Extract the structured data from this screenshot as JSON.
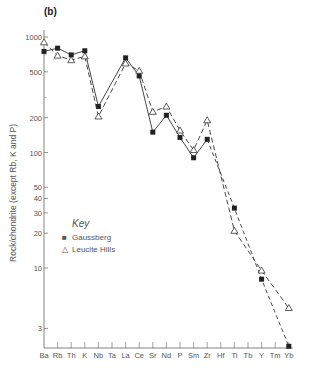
{
  "chart_data": {
    "type": "line",
    "title": "(b)",
    "xlabel": "",
    "ylabel": "Rock/chondrite (except Rb, K and P)",
    "yscale": "log",
    "ylim": [
      2,
      1000
    ],
    "yticks": [
      3,
      10,
      20,
      30,
      40,
      50,
      100,
      200,
      500,
      1000
    ],
    "categories": [
      "Ba",
      "Rb",
      "Th",
      "K",
      "Nb",
      "Ta",
      "La",
      "Ce",
      "Sr",
      "Nd",
      "P",
      "Sm",
      "Zr",
      "Hf",
      "Ti",
      "Tb",
      "Y",
      "Tm",
      "Yb"
    ],
    "series": [
      {
        "name": "Gaussberg",
        "marker": "filled-square",
        "line": "solid-then-dashed",
        "values": [
          750,
          800,
          700,
          760,
          250,
          null,
          660,
          460,
          150,
          210,
          135,
          90,
          130,
          null,
          33,
          null,
          8,
          null,
          2.1
        ]
      },
      {
        "name": "Leucite Hills",
        "marker": "open-triangle",
        "line": "dashed",
        "values": [
          900,
          690,
          630,
          680,
          205,
          null,
          590,
          510,
          225,
          250,
          155,
          105,
          190,
          null,
          21,
          null,
          9.5,
          null,
          4.5
        ]
      }
    ],
    "grid": false,
    "legend_position": "inside-lower-left"
  },
  "labels": {
    "panel": "(b)",
    "ylabel": "Rock/chondrite (except Rb, K and P)",
    "legend_title": "Key",
    "legend_items": [
      "Gaussberg",
      "Leucite Hills"
    ]
  }
}
